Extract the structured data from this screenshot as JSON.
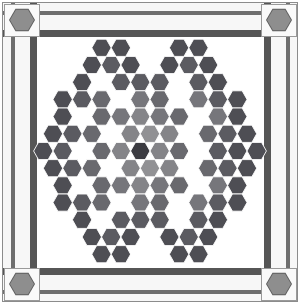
{
  "board": {
    "title": "Chinese Checkers Star Board",
    "frame_label": "wooden frame with corner bolts",
    "background_color": "#ffffff",
    "frame_color": "#5a5a5a",
    "frame_light_color": "#6e6e6e",
    "plate_color": "#f7f7f7",
    "corner_pad_color": "#fafafa",
    "corner_bolt_color": "#8e8e8e",
    "corner_bolt_ring_color": "#5d5d5d",
    "corner_bolt_count": 4,
    "corner_bolt_shape": "hexagon"
  },
  "star": {
    "shape": "six-pointed-star",
    "center_x": 150,
    "center_y": 151,
    "hex_width": 19.4,
    "hex_height": 17.2,
    "rows": 13,
    "empty_color": "#ffffff",
    "center_cell_color": "#3c3c42",
    "palette": {
      "darkest": "#4a4a50",
      "dark": "#56565c",
      "mid_dark": "#636368",
      "mid": "#6f6f74",
      "mid_light": "#7c7c80",
      "light": "#8a8a8d",
      "lightest": "#96969a",
      "empty": "#ffffff"
    },
    "rows_data": [
      {
        "row": 0,
        "y": 67,
        "x_start": 111,
        "cells": [
          "d1",
          "d1",
          "",
          "",
          "d1",
          "d1"
        ],
        "offsets": [
          0,
          1,
          2,
          3,
          4,
          5
        ]
      },
      {
        "row": 1,
        "y": 81,
        "x_start": 101,
        "cells": [
          "d1",
          "d2",
          "d1",
          "",
          "d1",
          "d2",
          "d1"
        ],
        "offsets": [
          0,
          1,
          2,
          3,
          4,
          5,
          6
        ]
      },
      {
        "row": 2,
        "y": 95,
        "x_start": 92,
        "cells": [
          "d1",
          "",
          "d2",
          "d2",
          "d2",
          "",
          "d2",
          "d1"
        ],
        "offsets": [
          0,
          1,
          2,
          3,
          4,
          5,
          6,
          7
        ]
      },
      {
        "row": 3,
        "y": 109,
        "x_start": 82,
        "cells": [
          "d1",
          "d2",
          "m1",
          "",
          "m2",
          "m1",
          "",
          "m2",
          "d2",
          "d1"
        ],
        "offsets": [
          0,
          1,
          2,
          3,
          4,
          5,
          6,
          7,
          8
        ]
      },
      {
        "row": 4,
        "y": 123,
        "x_start": 72,
        "cells": [
          "d1",
          "",
          "m1",
          "m2",
          "l1",
          "m2",
          "m1",
          "",
          "m2",
          "d1"
        ],
        "offsets": [
          0,
          1,
          2,
          3,
          4,
          5,
          6,
          7,
          8,
          9
        ]
      },
      {
        "row": 5,
        "y": 137,
        "x_start": 63,
        "cells": [
          "d1",
          "d2",
          "m1",
          "",
          "l1",
          "l2",
          "l1",
          "",
          "m1",
          "d2",
          "d1"
        ],
        "offsets": [
          0,
          1,
          2,
          3,
          4,
          5,
          6,
          7,
          8,
          9,
          10
        ]
      },
      {
        "row": 6,
        "y": 151,
        "x_start": 53,
        "cells": [
          "d1",
          "d2",
          "",
          "m1",
          "l1",
          "ctr",
          "l1",
          "m1",
          "",
          "d2",
          "d1",
          "d1"
        ],
        "offsets": [
          0,
          1,
          2,
          3,
          4,
          5,
          6,
          7,
          8,
          9,
          10,
          11
        ]
      },
      {
        "row": 7,
        "y": 165,
        "x_start": 63,
        "cells": [
          "d1",
          "d2",
          "m1",
          "",
          "l1",
          "l2",
          "l1",
          "",
          "m1",
          "d2",
          "d1"
        ],
        "offsets": [
          0,
          1,
          2,
          3,
          4,
          5,
          6,
          7,
          8,
          9,
          10
        ]
      },
      {
        "row": 8,
        "y": 179,
        "x_start": 72,
        "cells": [
          "d1",
          "",
          "m1",
          "m2",
          "l1",
          "m2",
          "m1",
          "",
          "m2",
          "d1"
        ],
        "offsets": [
          0,
          1,
          2,
          3,
          4,
          5,
          6,
          7,
          8,
          9
        ]
      },
      {
        "row": 9,
        "y": 193,
        "x_start": 82,
        "cells": [
          "d1",
          "d2",
          "m1",
          "",
          "m2",
          "m1",
          "",
          "m2",
          "d2",
          "d1"
        ],
        "offsets": [
          0,
          1,
          2,
          3,
          4,
          5,
          6,
          7,
          8
        ]
      },
      {
        "row": 10,
        "y": 207,
        "x_start": 92,
        "cells": [
          "d1",
          "",
          "d2",
          "d2",
          "d2",
          "",
          "d2",
          "d1"
        ],
        "offsets": [
          0,
          1,
          2,
          3,
          4,
          5,
          6,
          7
        ]
      },
      {
        "row": 11,
        "y": 221,
        "x_start": 101,
        "cells": [
          "d1",
          "d2",
          "d1",
          "",
          "d1",
          "d2",
          "d1"
        ],
        "offsets": [
          0,
          1,
          2,
          3,
          4,
          5,
          6
        ]
      },
      {
        "row": 12,
        "y": 235,
        "x_start": 111,
        "cells": [
          "d1",
          "d1",
          "",
          "",
          "d1",
          "d1"
        ],
        "offsets": [
          0,
          1,
          2,
          3,
          4,
          5
        ]
      }
    ]
  },
  "chart_data": {
    "type": "heatmap",
    "rows": 13,
    "columns_max": 13,
    "value_scale": [
      "empty",
      "lightest",
      "light",
      "mid_light",
      "mid",
      "mid_dark",
      "dark",
      "darkest",
      "center"
    ],
    "grid": [
      [
        "",
        "",
        "",
        "",
        "d1",
        "d1",
        "",
        "",
        "d1",
        "d1",
        "",
        "",
        ""
      ],
      [
        "",
        "",
        "",
        "d1",
        "d2",
        "d1",
        "",
        "d1",
        "d2",
        "d1",
        "",
        "",
        ""
      ],
      [
        "",
        "",
        "d1",
        "",
        "d2",
        "d2",
        "d2",
        "",
        "d2",
        "d1",
        "",
        "",
        ""
      ],
      [
        "",
        "d1",
        "d2",
        "m1",
        "",
        "m2",
        "m1",
        "",
        "m2",
        "d2",
        "d1",
        "",
        ""
      ],
      [
        "d1",
        "",
        "m1",
        "m2",
        "l1",
        "m2",
        "m1",
        "",
        "m2",
        "d1",
        "",
        "",
        ""
      ],
      [
        "d1",
        "d2",
        "m1",
        "",
        "l1",
        "l2",
        "l1",
        "",
        "m1",
        "d2",
        "d1",
        "",
        ""
      ],
      [
        "d1",
        "d2",
        "",
        "m1",
        "l1",
        "ctr",
        "l1",
        "m1",
        "",
        "d2",
        "d1",
        "d1",
        ""
      ],
      [
        "d1",
        "d2",
        "m1",
        "",
        "l1",
        "l2",
        "l1",
        "",
        "m1",
        "d2",
        "d1",
        "",
        ""
      ],
      [
        "d1",
        "",
        "m1",
        "m2",
        "l1",
        "m2",
        "m1",
        "",
        "m2",
        "d1",
        "",
        "",
        ""
      ],
      [
        "",
        "d1",
        "d2",
        "m1",
        "",
        "m2",
        "m1",
        "",
        "m2",
        "d2",
        "d1",
        "",
        ""
      ],
      [
        "",
        "",
        "d1",
        "",
        "d2",
        "d2",
        "d2",
        "",
        "d2",
        "d1",
        "",
        "",
        ""
      ],
      [
        "",
        "",
        "",
        "d1",
        "d2",
        "d1",
        "",
        "d1",
        "d2",
        "d1",
        "",
        "",
        ""
      ],
      [
        "",
        "",
        "",
        "",
        "d1",
        "d1",
        "",
        "",
        "d1",
        "d1",
        "",
        "",
        ""
      ]
    ],
    "colormap": {
      "d1": "#4e4e54",
      "d2": "#5b5b61",
      "m1": "#69696e",
      "m2": "#76767b",
      "l1": "#848488",
      "l2": "#919194",
      "ctr": "#3c3c42",
      "": "#ffffff"
    },
    "legend_position": "none",
    "grid_on": false,
    "xlabel": "",
    "ylabel": ""
  }
}
